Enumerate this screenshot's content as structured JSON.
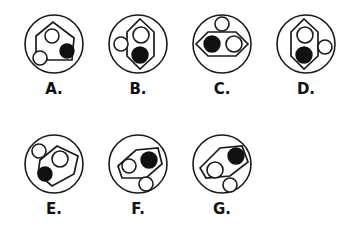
{
  "page": {
    "background_color": "#ffffff",
    "line_color": "#1a1a1a",
    "fill_black": "#111111",
    "fill_white": "#ffffff"
  },
  "layout": {
    "rows": [
      {
        "row_index": 0,
        "items": [
          "A",
          "B",
          "C",
          "D"
        ]
      },
      {
        "row_index": 1,
        "items": [
          "E",
          "F",
          "G"
        ]
      }
    ]
  },
  "figures": [
    {
      "id": "A",
      "label": "A.",
      "cell": {
        "x": 12,
        "y": 6
      },
      "outer_circle": {
        "cx": 42,
        "cy": 38,
        "r": 29
      },
      "polygon": {
        "shape": "pentagon",
        "points": "24,30 41,16 62,32 60,54 36,54 24,46"
      },
      "dots": [
        {
          "name": "white-dot-inside-upper",
          "cx": 40,
          "cy": 30,
          "r": 7,
          "fill": "white"
        },
        {
          "name": "black-dot-inside-lower-right",
          "cx": 55,
          "cy": 45,
          "r": 7,
          "fill": "black"
        },
        {
          "name": "white-dot-outside-lower-left",
          "cx": 28,
          "cy": 52,
          "r": 7,
          "fill": "white"
        }
      ]
    },
    {
      "id": "B",
      "label": "B.",
      "cell": {
        "x": 96,
        "y": 6
      },
      "outer_circle": {
        "cx": 42,
        "cy": 38,
        "r": 29
      },
      "polygon": {
        "shape": "hexagon-vertical",
        "points": "44,13 58,26 58,50 44,63 31,50 31,26"
      },
      "dots": [
        {
          "name": "white-dot-inside-upper",
          "cx": 45,
          "cy": 29,
          "r": 8,
          "fill": "white"
        },
        {
          "name": "black-dot-inside-lower",
          "cx": 44,
          "cy": 49,
          "r": 8,
          "fill": "black"
        },
        {
          "name": "white-dot-outside-left",
          "cx": 25,
          "cy": 38,
          "r": 7,
          "fill": "white"
        }
      ]
    },
    {
      "id": "C",
      "label": "C.",
      "cell": {
        "x": 180,
        "y": 6
      },
      "outer_circle": {
        "cx": 42,
        "cy": 38,
        "r": 29
      },
      "polygon": {
        "shape": "hexagon-horizontal",
        "points": "16,38 28,26 56,26 68,38 56,50 28,50"
      },
      "dots": [
        {
          "name": "black-dot-inside-left",
          "cx": 32,
          "cy": 38,
          "r": 8,
          "fill": "black"
        },
        {
          "name": "white-dot-inside-right",
          "cx": 54,
          "cy": 38,
          "r": 8,
          "fill": "white"
        },
        {
          "name": "white-dot-outside-top",
          "cx": 42,
          "cy": 18,
          "r": 7,
          "fill": "white"
        }
      ]
    },
    {
      "id": "D",
      "label": "D.",
      "cell": {
        "x": 264,
        "y": 6
      },
      "outer_circle": {
        "cx": 42,
        "cy": 38,
        "r": 29
      },
      "polygon": {
        "shape": "hexagon-vertical",
        "points": "40,13 54,26 54,50 40,63 27,50 27,26"
      },
      "dots": [
        {
          "name": "white-dot-inside-upper",
          "cx": 41,
          "cy": 29,
          "r": 8,
          "fill": "white"
        },
        {
          "name": "black-dot-inside-lower",
          "cx": 40,
          "cy": 49,
          "r": 8,
          "fill": "black"
        },
        {
          "name": "white-dot-outside-right",
          "cx": 61,
          "cy": 41,
          "r": 7,
          "fill": "white"
        }
      ]
    },
    {
      "id": "E",
      "label": "E.",
      "cell": {
        "x": 12,
        "y": 126
      },
      "outer_circle": {
        "cx": 42,
        "cy": 38,
        "r": 29
      },
      "polygon": {
        "shape": "pentagon-tilted",
        "points": "28,34 45,20 66,30 62,48 40,60 26,48"
      },
      "dots": [
        {
          "name": "white-dot-inside-upper-right",
          "cx": 48,
          "cy": 33,
          "r": 8,
          "fill": "white"
        },
        {
          "name": "black-dot-inside-lower-left",
          "cx": 33,
          "cy": 48,
          "r": 7,
          "fill": "black"
        },
        {
          "name": "white-dot-outside-upper-left",
          "cx": 27,
          "cy": 25,
          "r": 7,
          "fill": "white"
        }
      ]
    },
    {
      "id": "F",
      "label": "F.",
      "cell": {
        "x": 96,
        "y": 126
      },
      "outer_circle": {
        "cx": 42,
        "cy": 38,
        "r": 29
      },
      "polygon": {
        "shape": "pentagon-tilted",
        "points": "22,40 40,24 62,22 66,38 50,52 26,52"
      },
      "dots": [
        {
          "name": "white-dot-inside-left",
          "cx": 33,
          "cy": 40,
          "r": 7,
          "fill": "white"
        },
        {
          "name": "black-dot-inside-right",
          "cx": 53,
          "cy": 34,
          "r": 8,
          "fill": "black"
        },
        {
          "name": "white-dot-outside-lower-right",
          "cx": 50,
          "cy": 58,
          "r": 7,
          "fill": "white"
        }
      ]
    },
    {
      "id": "G",
      "label": "G.",
      "cell": {
        "x": 180,
        "y": 126
      },
      "outer_circle": {
        "cx": 42,
        "cy": 38,
        "r": 29
      },
      "polygon": {
        "shape": "pentagon-tilted",
        "points": "20,42 40,22 62,20 68,36 50,50 26,52"
      },
      "dots": [
        {
          "name": "white-dot-inside-left",
          "cx": 35,
          "cy": 44,
          "r": 8,
          "fill": "white"
        },
        {
          "name": "black-dot-inside-upper-right",
          "cx": 56,
          "cy": 30,
          "r": 8,
          "fill": "black"
        },
        {
          "name": "white-dot-outside-lower-right",
          "cx": 50,
          "cy": 59,
          "r": 7,
          "fill": "white"
        }
      ]
    }
  ]
}
